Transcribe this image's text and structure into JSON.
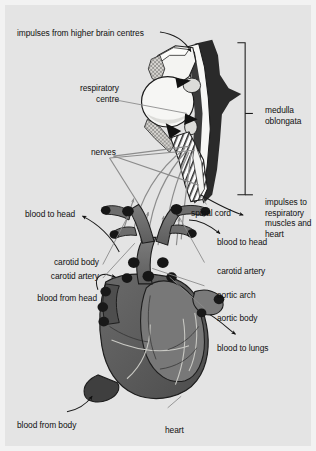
{
  "figure": {
    "background_color": "#e4e4e4",
    "frame_color": "#f2f2f2",
    "ink_color": "#101010"
  },
  "labels": {
    "impulses_from_brain": "impulses from higher brain centres",
    "respiratory_centre": "respiratory\ncentre",
    "nerves": "nerves",
    "spinal_cord": "spinal cord",
    "medulla_oblongata": "medulla\noblongata",
    "impulses_to_muscles": "impulses to\nrespiratory\nmuscles and\nheart",
    "blood_to_head_left": "blood to head",
    "blood_to_head_right": "blood to head",
    "carotid_body": "carotid body",
    "carotid_artery_left": "carotid artery",
    "carotid_artery_right": "carotid artery",
    "aortic_arch": "aortic arch",
    "aortic_body": "aortic body",
    "blood_from_head": "blood from head",
    "blood_to_lungs": "blood to lungs",
    "blood_from_body": "blood from body",
    "heart": "heart"
  },
  "anatomy": {
    "parts": [
      {
        "name": "respiratory-centre",
        "kind": "nucleus",
        "fill": "#f4f4f2"
      },
      {
        "name": "medulla-oblongata",
        "kind": "brainstem",
        "fill": "#2a2a2a"
      },
      {
        "name": "spinal-cord",
        "kind": "cord",
        "fill": "#fbfbfb"
      },
      {
        "name": "carotid-artery",
        "kind": "vessel",
        "fill": "#6d6d6d"
      },
      {
        "name": "carotid-body",
        "kind": "chemoreceptor",
        "fill": "#1e1e1e"
      },
      {
        "name": "aortic-arch",
        "kind": "vessel",
        "fill": "#6d6d6d"
      },
      {
        "name": "aortic-body",
        "kind": "chemoreceptor",
        "fill": "#1e1e1e"
      },
      {
        "name": "heart",
        "kind": "organ",
        "fill": "#5e5e5e"
      },
      {
        "name": "vena-cava",
        "kind": "vessel",
        "fill": "#4a4a4a"
      },
      {
        "name": "pulmonary-artery",
        "kind": "vessel",
        "fill": "#7a7a7a"
      }
    ],
    "nerve_count": 4,
    "nerve_color": "#8c8c8c",
    "arrow_color": "#101010"
  }
}
